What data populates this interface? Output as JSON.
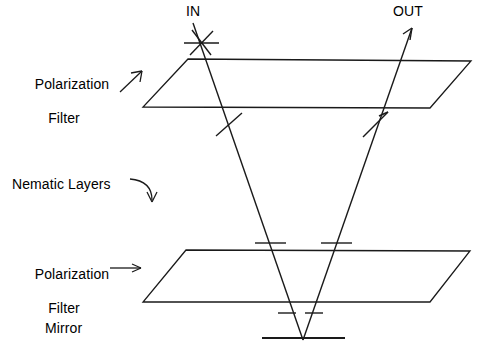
{
  "figure": {
    "background_color": "#ffffff",
    "stroke_color": "#1a1a1a",
    "width": 479,
    "height": 350
  },
  "labels": {
    "in": "IN",
    "out": "OUT",
    "polarization_top_line1": "Polarization",
    "polarization_top_line2": "Filter",
    "nematic": "Nematic Layers",
    "polarization_bottom_line1": "Polarization",
    "polarization_bottom_line2": "Filter",
    "mirror": "Mirror"
  },
  "components": [
    {
      "name": "top-polarization-filter",
      "type": "parallelogram",
      "label": "Polarization Filter"
    },
    {
      "name": "nematic-layers",
      "type": "region",
      "label": "Nematic Layers"
    },
    {
      "name": "bottom-polarization-filter",
      "type": "parallelogram",
      "label": "Polarization Filter"
    },
    {
      "name": "mirror",
      "type": "line",
      "label": "Mirror"
    }
  ],
  "rays": [
    {
      "name": "incoming-ray",
      "label": "IN",
      "direction": "down-right"
    },
    {
      "name": "outgoing-ray",
      "label": "OUT",
      "direction": "up-right"
    }
  ],
  "geometry": {
    "top_filter": {
      "top_left": [
        188,
        59
      ],
      "top_right": [
        471,
        61
      ],
      "bottom_right": [
        430,
        108
      ],
      "bottom_left": [
        143,
        107
      ]
    },
    "bottom_filter": {
      "top_left": [
        186,
        250
      ],
      "top_right": [
        470,
        251
      ],
      "bottom_right": [
        430,
        302
      ],
      "bottom_left": [
        143,
        302
      ]
    },
    "mirror_line": {
      "x1": 262,
      "y1": 338,
      "x2": 345,
      "y2": 338
    },
    "in_ray": {
      "x1": 193,
      "y1": 23,
      "x2": 303,
      "y2": 340
    },
    "out_ray": {
      "x1": 303,
      "y1": 340,
      "x2": 412,
      "y2": 28
    },
    "polarization_marks": [
      {
        "name": "in-cross-mark",
        "x": 201,
        "y": 43,
        "type": "asterisk"
      },
      {
        "name": "in-slash-mark",
        "x": 229,
        "y": 124,
        "type": "slash"
      },
      {
        "name": "out-arrow-mark",
        "x": 375,
        "y": 124,
        "type": "arrow-slash"
      },
      {
        "name": "in-bar-mark-upper",
        "x": 270,
        "y": 243,
        "type": "bar"
      },
      {
        "name": "out-bar-mark-upper",
        "x": 337,
        "y": 243,
        "type": "bar"
      },
      {
        "name": "in-bar-mark-lower",
        "x": 287,
        "y": 313,
        "type": "bar"
      },
      {
        "name": "out-bar-mark-lower",
        "x": 317,
        "y": 313,
        "type": "bar"
      }
    ]
  },
  "arrows": [
    {
      "name": "top-filter-pointer",
      "style": "diagonal-up-right",
      "from": [
        121,
        91
      ],
      "to": [
        142,
        72
      ]
    },
    {
      "name": "nematic-pointer",
      "style": "curved-down-right",
      "from": [
        130,
        180
      ],
      "to": [
        152,
        201
      ]
    },
    {
      "name": "bottom-filter-pointer",
      "style": "horizontal-right",
      "from": [
        110,
        268
      ],
      "to": [
        141,
        268
      ]
    }
  ]
}
